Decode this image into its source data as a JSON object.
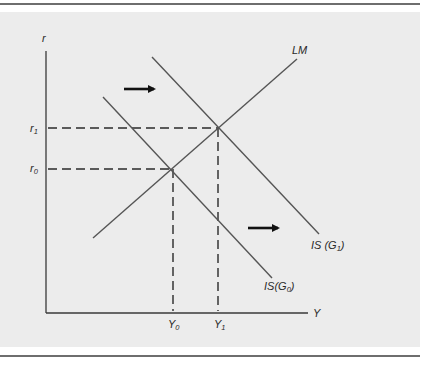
{
  "diagram": {
    "type": "IS-LM fiscal expansion",
    "axes": {
      "y_label": "r",
      "x_label": "Y"
    },
    "curves": [
      {
        "id": "LM",
        "label": "LM"
      },
      {
        "id": "IS_G0",
        "label_main": "IS(G",
        "label_sub": "0",
        "label_close": ")"
      },
      {
        "id": "IS_G1",
        "label_main": "IS (G",
        "label_sub": "1",
        "label_close": ")"
      }
    ],
    "equilibria": [
      {
        "id": "E0",
        "r_label_main": "r",
        "r_label_sub": "0",
        "y_label_main": "Y",
        "y_label_sub": "0"
      },
      {
        "id": "E1",
        "r_label_main": "r",
        "r_label_sub": "1",
        "y_label_main": "Y",
        "y_label_sub": "1"
      }
    ],
    "arrows": [
      {
        "id": "shift-arrow-upper",
        "direction": "right"
      },
      {
        "id": "shift-arrow-lower",
        "direction": "right"
      }
    ],
    "colors": {
      "panel": "#ececec",
      "curve": "#555555",
      "axis": "#3a3a3a",
      "arrow": "#111111",
      "rule": "#6e6e6e"
    }
  }
}
